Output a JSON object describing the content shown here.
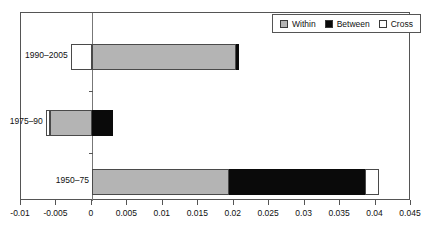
{
  "chart_data": {
    "type": "bar",
    "orientation": "horizontal",
    "stacked": true,
    "title": "",
    "xlabel": "",
    "ylabel": "",
    "categories": [
      "1990–2005",
      "1975–90",
      "1950–75"
    ],
    "series": [
      {
        "name": "Within",
        "values": [
          0.0203,
          0.0059,
          0.0194
        ]
      },
      {
        "name": "Between",
        "values": [
          0.0005,
          0.003,
          0.0191
        ]
      },
      {
        "name": "Cross",
        "values": [
          -0.003,
          -0.0065,
          0.002
        ]
      }
    ],
    "segments": [
      {
        "category": "1990–2005",
        "parts": [
          {
            "name": "Cross",
            "start": -0.003,
            "end": 0.0
          },
          {
            "name": "Within",
            "start": 0.0,
            "end": 0.0203
          },
          {
            "name": "Between",
            "start": 0.0203,
            "end": 0.0208
          }
        ]
      },
      {
        "category": "1975–90",
        "parts": [
          {
            "name": "Cross",
            "start": -0.0065,
            "end": -0.0059
          },
          {
            "name": "Within",
            "start": -0.0059,
            "end": 0.0
          },
          {
            "name": "Between",
            "start": 0.0,
            "end": 0.003
          }
        ]
      },
      {
        "category": "1950–75",
        "parts": [
          {
            "name": "Within",
            "start": 0.0,
            "end": 0.0194
          },
          {
            "name": "Between",
            "start": 0.0194,
            "end": 0.0385
          },
          {
            "name": "Cross",
            "start": 0.0385,
            "end": 0.0405
          }
        ]
      }
    ],
    "xlim": [
      -0.01,
      0.045
    ],
    "xticks": [
      -0.01,
      -0.005,
      0,
      0.005,
      0.01,
      0.015,
      0.02,
      0.025,
      0.03,
      0.035,
      0.04,
      0.045
    ],
    "xtick_labels": [
      "-0.01",
      "-0.005",
      "0",
      "0.005",
      "0.01",
      "0.015",
      "0.02",
      "0.025",
      "0.03",
      "0.035",
      "0.04",
      "0.045"
    ],
    "grid": false,
    "legend": {
      "position": "top-right",
      "entries": [
        {
          "label": "Within",
          "color": "#b4b4b4"
        },
        {
          "label": "Between",
          "color": "#0a0a0a"
        },
        {
          "label": "Cross",
          "color": "#ffffff"
        }
      ]
    },
    "colors": {
      "within": "#b4b4b4",
      "between": "#0a0a0a",
      "cross": "#ffffff",
      "axis": "#555555"
    }
  }
}
